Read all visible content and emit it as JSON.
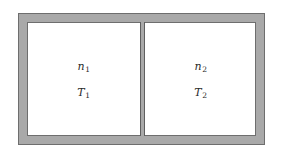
{
  "figure": {
    "type": "physics-diagram",
    "colors": {
      "wall_fill": "#a9a9a9",
      "wall_outline": "#6e6e6e",
      "partition_fill": "#a9a9a9",
      "partition_outline": "#5f5f5f",
      "cavity_fill": "#ffffff",
      "label_color": "#2b2b2b",
      "background": "#ffffff"
    },
    "geometry": {
      "frame_left": 18,
      "frame_top": 13,
      "frame_width": 247,
      "frame_height": 132,
      "wall_thickness": 9,
      "partition_x": 140,
      "partition_width": 5
    },
    "chambers": [
      {
        "id": "left",
        "labels": [
          {
            "symbol": "n",
            "subscript": "1",
            "quantity": "moles"
          },
          {
            "symbol": "T",
            "subscript": "1",
            "quantity": "temperature"
          }
        ]
      },
      {
        "id": "right",
        "labels": [
          {
            "symbol": "n",
            "subscript": "2",
            "quantity": "moles"
          },
          {
            "symbol": "T",
            "subscript": "2",
            "quantity": "temperature"
          }
        ]
      }
    ]
  }
}
